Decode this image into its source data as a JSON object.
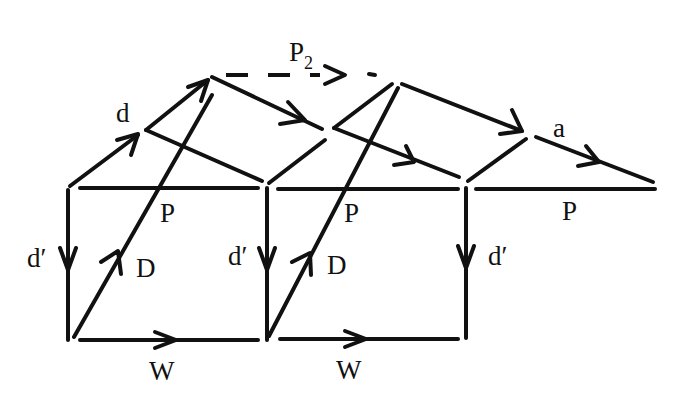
{
  "diagram": {
    "type": "commutative-diagram",
    "labels": {
      "P2_base": "P",
      "P2_sub": "2",
      "d": "d",
      "a": "a",
      "P_left": "P",
      "P_mid": "P",
      "P_right": "P",
      "dprime_left": "d′",
      "dprime_mid": "d′",
      "dprime_right": "d′",
      "D_left": "D",
      "D_mid": "D",
      "W_left": "W",
      "W_mid": "W"
    },
    "arrows": [
      {
        "label": "d",
        "direction": "up-right"
      },
      {
        "label": "P2",
        "style": "dashed",
        "direction": "right"
      },
      {
        "label": "a",
        "direction": "down-right"
      },
      {
        "label": "d′",
        "direction": "down"
      },
      {
        "label": "D",
        "direction": "up-right"
      },
      {
        "label": "W",
        "direction": "right"
      }
    ],
    "stroke_color": "#111111"
  }
}
